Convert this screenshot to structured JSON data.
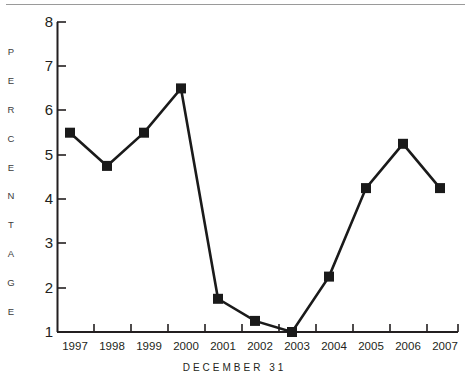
{
  "chart_data": {
    "type": "line",
    "title": "",
    "subtitle": "",
    "xlabel": "DECEMBER 31",
    "ylabel": "PERCENTAGE",
    "ylabel_letters": [
      "P",
      "E",
      "R",
      "C",
      "E",
      "N",
      "T",
      "A",
      "G",
      "E"
    ],
    "categories": [
      "1997",
      "1998",
      "1999",
      "2000",
      "2001",
      "2002",
      "2003",
      "2004",
      "2005",
      "2006",
      "2007"
    ],
    "x_tick_labels": [
      "1997",
      "1998",
      "1999",
      "2000",
      "2001",
      "2002",
      "2003",
      "2004",
      "2005",
      "2006",
      "2007"
    ],
    "y_tick_labels": [
      "8",
      "7",
      "6",
      "5",
      "4",
      "3",
      "2",
      "1"
    ],
    "y_ticks": [
      8,
      7,
      6,
      5,
      4,
      3,
      2,
      1
    ],
    "ylim": [
      1,
      8
    ],
    "values": [
      5.5,
      4.75,
      5.5,
      6.5,
      1.75,
      1.25,
      1.0,
      2.25,
      4.25,
      5.25,
      4.25
    ],
    "series": [
      {
        "name": "Percentage",
        "values": [
          5.5,
          4.75,
          5.5,
          6.5,
          1.75,
          1.25,
          1.0,
          2.25,
          4.25,
          5.25,
          4.25
        ]
      }
    ],
    "grid": false,
    "legend": false,
    "legend_position": "none",
    "marker": "square",
    "line_color": "#1a1a1a",
    "marker_color": "#1a1a1a",
    "axis_color": "#231f20",
    "rule_color": "#9a9a9a",
    "background": "#ffffff"
  }
}
